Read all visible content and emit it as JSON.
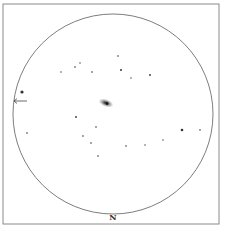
{
  "chart": {
    "type": "finder-chart",
    "orientation_label": "N",
    "colors": {
      "frame": "#8a8a8a",
      "circle": "#6e6e6e",
      "star": "#333333",
      "galaxy_core": "#2a2a2a",
      "galaxy_halo": "#9a9a9a",
      "background": "#ffffff"
    },
    "frame": {
      "x": 3,
      "y": 4,
      "width": 216,
      "height": 220
    },
    "field_circle": {
      "cx": 113,
      "cy": 114,
      "r": 100
    },
    "galaxy": {
      "cx": 106,
      "cy": 103,
      "rx": 8,
      "ry": 4,
      "rotation": 20
    },
    "marker_arrow": {
      "x1": 27,
      "y1": 101,
      "x2": 14,
      "y2": 101
    },
    "stars": [
      {
        "x": 22,
        "y": 92,
        "r": 1.6
      },
      {
        "x": 61,
        "y": 72,
        "r": 0.7
      },
      {
        "x": 75,
        "y": 67,
        "r": 0.8
      },
      {
        "x": 80,
        "y": 63,
        "r": 0.7
      },
      {
        "x": 92,
        "y": 72,
        "r": 0.8
      },
      {
        "x": 118,
        "y": 56,
        "r": 0.8
      },
      {
        "x": 121,
        "y": 70,
        "r": 1.0
      },
      {
        "x": 131,
        "y": 78,
        "r": 0.7
      },
      {
        "x": 150,
        "y": 75,
        "r": 0.9
      },
      {
        "x": 27,
        "y": 133,
        "r": 0.8
      },
      {
        "x": 76,
        "y": 117,
        "r": 0.9
      },
      {
        "x": 83,
        "y": 136,
        "r": 0.8
      },
      {
        "x": 96,
        "y": 127,
        "r": 0.8
      },
      {
        "x": 91,
        "y": 143,
        "r": 0.8
      },
      {
        "x": 98,
        "y": 156,
        "r": 0.8
      },
      {
        "x": 126,
        "y": 146,
        "r": 0.8
      },
      {
        "x": 145,
        "y": 145,
        "r": 0.7
      },
      {
        "x": 163,
        "y": 140,
        "r": 0.7
      },
      {
        "x": 182,
        "y": 130,
        "r": 1.3
      },
      {
        "x": 200,
        "y": 130,
        "r": 0.8
      }
    ]
  }
}
